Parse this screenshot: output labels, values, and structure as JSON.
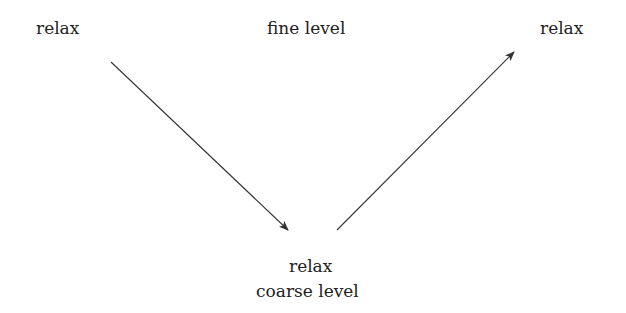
{
  "diagram": {
    "type": "multigrid-v-cycle",
    "labels": {
      "top_left": "relax",
      "top_center": "fine level",
      "top_right": "relax",
      "bottom_relax": "relax",
      "bottom_level": "coarse level"
    },
    "arrows": [
      {
        "name": "restrict-arrow",
        "from": [
          111,
          62
        ],
        "to": [
          288,
          230
        ]
      },
      {
        "name": "prolong-arrow",
        "from": [
          337,
          230
        ],
        "to": [
          514,
          52
        ]
      }
    ],
    "colors": {
      "line": "#333333",
      "text": "#222222",
      "background": "#ffffff"
    }
  }
}
